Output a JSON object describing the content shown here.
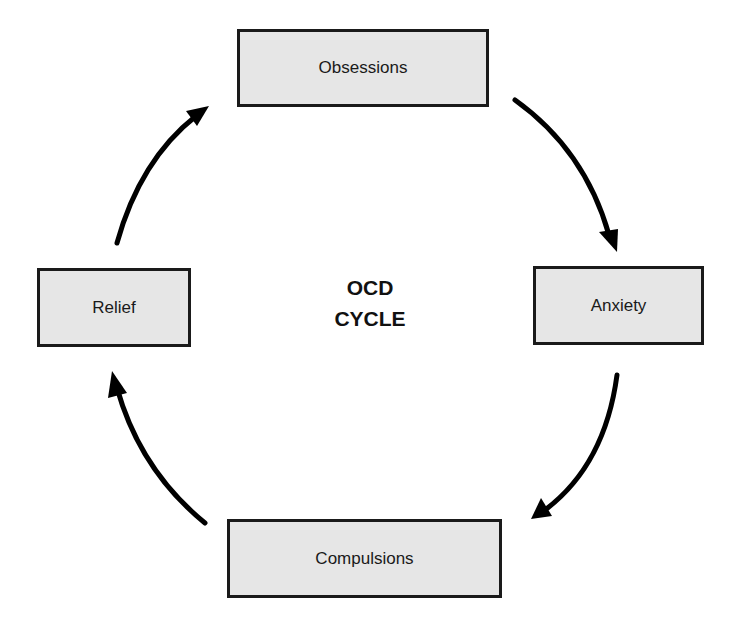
{
  "diagram": {
    "type": "cycle",
    "center_label": {
      "line1": "OCD",
      "line2": "CYCLE"
    },
    "nodes": [
      {
        "id": "obsessions",
        "label": "Obsessions"
      },
      {
        "id": "anxiety",
        "label": "Anxiety"
      },
      {
        "id": "compulsions",
        "label": "Compulsions"
      },
      {
        "id": "relief",
        "label": "Relief"
      }
    ],
    "edges": [
      {
        "from": "Obsessions",
        "to": "Anxiety"
      },
      {
        "from": "Anxiety",
        "to": "Compulsions"
      },
      {
        "from": "Compulsions",
        "to": "Relief"
      },
      {
        "from": "Relief",
        "to": "Obsessions"
      }
    ],
    "colors": {
      "box_fill": "#e6e6e6",
      "box_border": "#1a1a1a",
      "arrow": "#000000"
    }
  }
}
